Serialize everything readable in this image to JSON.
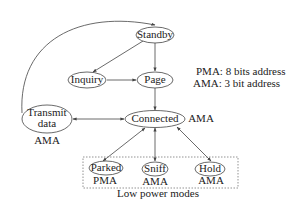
{
  "diagram": {
    "nodes": {
      "standby": {
        "label": "Standby"
      },
      "inquiry": {
        "label": "Inquiry"
      },
      "page": {
        "label": "Page"
      },
      "connected": {
        "label": "Connected",
        "address": "AMA"
      },
      "transmit": {
        "label_line1": "Transmit",
        "label_line2": "data",
        "address": "AMA"
      },
      "parked": {
        "label": "Parked",
        "address": "PMA"
      },
      "sniff": {
        "label": "Sniff",
        "address": "AMA"
      },
      "hold": {
        "label": "Hold",
        "address": "AMA"
      }
    },
    "group": {
      "label": "Low power modes"
    },
    "legend": [
      "PMA: 8 bits address",
      "AMA: 3 bit address"
    ],
    "edges": [
      {
        "from": "transmit",
        "to": "standby",
        "style": "curved"
      },
      {
        "from": "standby",
        "to": "inquiry"
      },
      {
        "from": "standby",
        "to": "page"
      },
      {
        "from": "inquiry",
        "to": "page"
      },
      {
        "from": "page",
        "to": "connected"
      },
      {
        "from": "transmit",
        "to": "connected",
        "bidirectional": true
      },
      {
        "from": "connected",
        "to": "parked",
        "bidirectional": true
      },
      {
        "from": "connected",
        "to": "sniff",
        "bidirectional": true
      },
      {
        "from": "connected",
        "to": "hold",
        "bidirectional": true
      }
    ]
  }
}
